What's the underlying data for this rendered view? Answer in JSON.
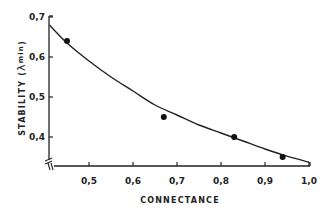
{
  "chart_data": {
    "type": "scatter",
    "title": "",
    "xlabel": "CONNECTANCE",
    "ylabel": "STABILITY (λ min)",
    "ylabel_parts": {
      "main": "STABILITY (",
      "symbol": "λ",
      "subscript": "min",
      "close": ")"
    },
    "xlim": [
      0.41,
      1.0
    ],
    "ylim": [
      0.33,
      0.7
    ],
    "x_ticks": [
      0.5,
      0.6,
      0.7,
      0.8,
      0.9,
      1.0
    ],
    "x_tick_labels": [
      "0,5",
      "0,6",
      "0,7",
      "0,8",
      "0,9",
      "1,0"
    ],
    "y_ticks": [
      0.4,
      0.5,
      0.6,
      0.7
    ],
    "y_tick_labels": [
      "0,4",
      "0,5",
      "0,6",
      "0,7"
    ],
    "grid": false,
    "legend": null,
    "axis_breaks": true,
    "series": [
      {
        "name": "observed",
        "kind": "points",
        "x": [
          0.45,
          0.67,
          0.83,
          0.94
        ],
        "y": [
          0.64,
          0.45,
          0.4,
          0.35
        ]
      },
      {
        "name": "fitted curve",
        "kind": "line",
        "x": [
          0.41,
          0.45,
          0.5,
          0.55,
          0.6,
          0.65,
          0.7,
          0.75,
          0.8,
          0.85,
          0.9,
          0.95,
          1.0
        ],
        "y": [
          0.68,
          0.635,
          0.59,
          0.55,
          0.515,
          0.48,
          0.455,
          0.43,
          0.41,
          0.39,
          0.37,
          0.352,
          0.337
        ]
      }
    ]
  },
  "colors": {
    "ink": "#222222",
    "background": "#ffffff"
  }
}
